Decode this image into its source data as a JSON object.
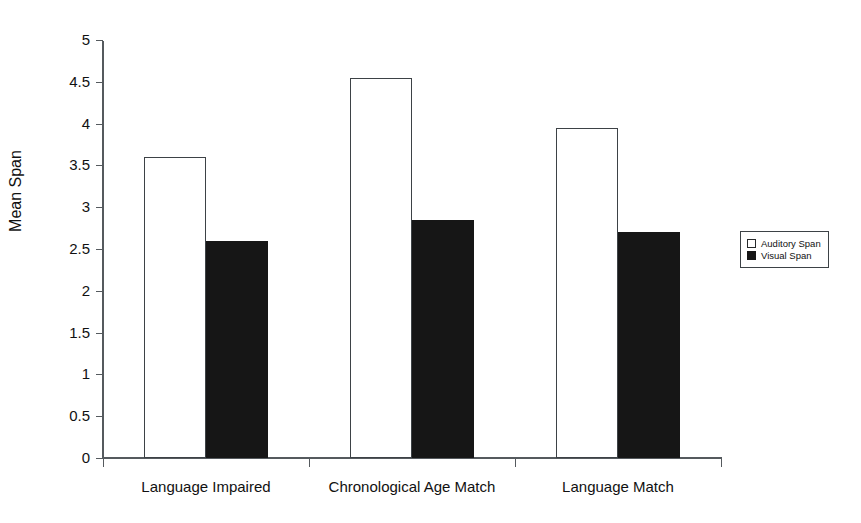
{
  "chart_data": {
    "type": "bar",
    "title": "",
    "xlabel": "",
    "ylabel": "Mean Span",
    "categories": [
      "Language Impaired",
      "Chronological Age Match",
      "Language Match"
    ],
    "series": [
      {
        "name": "Auditory Span",
        "values": [
          3.6,
          4.55,
          3.95
        ],
        "style": "open",
        "color": "#ffffff",
        "edge_color": "#3d4246"
      },
      {
        "name": "Visual Span",
        "values": [
          2.6,
          2.85,
          2.7
        ],
        "style": "filled",
        "color": "#161616",
        "edge_color": "#161616"
      }
    ],
    "ylim": [
      0,
      5
    ],
    "ytick_labels": [
      "0",
      "0.5",
      "1",
      "1.5",
      "2",
      "2.5",
      "3",
      "3.5",
      "4",
      "4.5",
      "5"
    ],
    "ytick_values": [
      0,
      0.5,
      1,
      1.5,
      2,
      2.5,
      3,
      3.5,
      4,
      4.5,
      5
    ],
    "grid": false,
    "legend_position": "right",
    "legend_entries": [
      "Auditory Span",
      "Visual Span"
    ],
    "background_color": "#ffffff",
    "axis_color": "#555a5e"
  }
}
